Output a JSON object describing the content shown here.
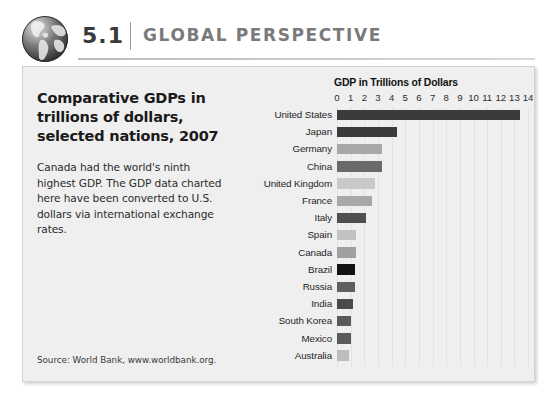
{
  "header": {
    "globe_icon": "globe-icon",
    "chapter_number": "5.1",
    "title": "GLOBAL PERSPECTIVE"
  },
  "panel": {
    "title": "Comparative GDPs in trillions of dollars, selected nations, 2007",
    "body": "Canada had the world's ninth highest GDP. The GDP data charted here have been converted to U.S. dollars via international exchange rates.",
    "source": "Source: World Bank, www.worldbank.org."
  },
  "colors": {
    "panel_background": "#efefef",
    "panel_border": "#d2d2d2",
    "header_title": "#7a7a7a",
    "chapter_number": "#3a3a3a",
    "gridline": "#e3e3e3"
  },
  "chart_data": {
    "type": "bar",
    "orientation": "horizontal",
    "title": "GDP in Trillions of Dollars",
    "xlabel": "GDP in Trillions of Dollars",
    "ylabel": "",
    "xlim": [
      0,
      14
    ],
    "xticks": [
      0,
      1,
      2,
      3,
      4,
      5,
      6,
      7,
      8,
      9,
      10,
      11,
      12,
      13,
      14
    ],
    "grid": true,
    "legend": false,
    "categories": [
      "United States",
      "Japan",
      "Germany",
      "China",
      "United Kingdom",
      "France",
      "Italy",
      "Spain",
      "Canada",
      "Brazil",
      "Russia",
      "India",
      "South Korea",
      "Mexico",
      "Australia"
    ],
    "values": [
      13.4,
      4.4,
      3.3,
      3.3,
      2.8,
      2.6,
      2.1,
      1.4,
      1.4,
      1.3,
      1.3,
      1.2,
      1.0,
      1.0,
      0.9
    ],
    "bar_colors": [
      "#3b3b3b",
      "#3b3b3b",
      "#a8a8a8",
      "#6a6a6a",
      "#c9c9c9",
      "#a8a8a8",
      "#4f4f4f",
      "#c2c2c2",
      "#a0a0a0",
      "#121212",
      "#5f5f5f",
      "#4b4b4b",
      "#5a5a5a",
      "#5a5a5a",
      "#bdbdbd"
    ]
  }
}
